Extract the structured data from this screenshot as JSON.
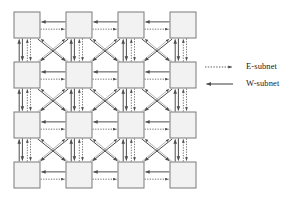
{
  "figure": {
    "type": "network-topology-diagram",
    "background_color": "#ffffff"
  },
  "network": {
    "rows": 4,
    "cols": 4,
    "node_count": 16,
    "node": {
      "width": 26,
      "height": 26,
      "fill_color": "#f2f2f2",
      "border_color": "#7a7a7a",
      "border_width": 1
    },
    "origin_x": 14,
    "origin_y": 12,
    "step_x": 52,
    "step_y": 50,
    "link_types": [
      "E-subnet",
      "W-subnet"
    ],
    "link_directions": [
      "horizontal",
      "vertical",
      "diagonal"
    ]
  },
  "legend": {
    "position": "right",
    "entries": [
      {
        "id": "e-subnet",
        "label": "E-subnet",
        "style": "dotted",
        "arrow": "right",
        "color": "#4d4d4d"
      },
      {
        "id": "w-subnet",
        "label": "W-subnet",
        "style": "solid",
        "arrow": "left",
        "color": "#4d4d4d"
      }
    ]
  },
  "colors": {
    "line": "#4d4d4d",
    "node_fill": "#f2f2f2",
    "node_stroke": "#7a7a7a",
    "text": "#1a1a1a"
  }
}
